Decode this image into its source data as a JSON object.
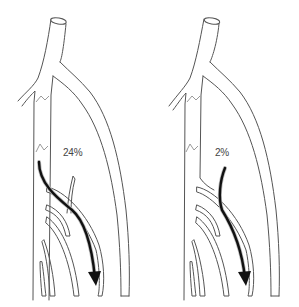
{
  "figure": {
    "panels": [
      {
        "id": "left",
        "label": "24%",
        "flow_description": "reflux from main trunk through branch into lower tributary"
      },
      {
        "id": "right",
        "label": "2%",
        "flow_description": "reflux starting in side branch into lower tributary"
      }
    ],
    "colors": {
      "vessel_outline": "#555555",
      "valve": "#9a9a9a",
      "flow_arrow": "#111111",
      "background": "#ffffff"
    }
  }
}
